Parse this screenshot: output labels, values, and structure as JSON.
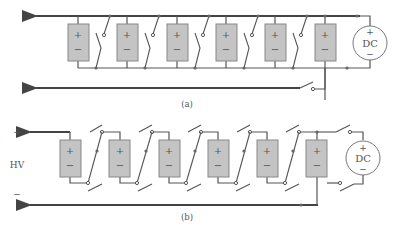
{
  "figure": {
    "panel_a": {
      "label": "(a)",
      "source": {
        "label": "DC",
        "plus": "+",
        "minus": "−"
      },
      "cells": [
        {
          "plus": "+",
          "minus": "−"
        },
        {
          "plus": "+",
          "minus": "−"
        },
        {
          "plus": "+",
          "minus": "−"
        },
        {
          "plus": "+",
          "minus": "−"
        },
        {
          "plus": "+",
          "minus": "−"
        },
        {
          "plus": "+",
          "minus": "−"
        }
      ]
    },
    "panel_b": {
      "label": "(b)",
      "output_label": "HV",
      "output_plus": "+",
      "output_minus": "−",
      "source": {
        "label": "DC",
        "plus": "+",
        "minus": "−"
      },
      "cells": [
        {
          "plus": "+",
          "minus": "−"
        },
        {
          "plus": "+",
          "minus": "−"
        },
        {
          "plus": "+",
          "minus": "−"
        },
        {
          "plus": "+",
          "minus": "−"
        },
        {
          "plus": "+",
          "minus": "−"
        },
        {
          "plus": "+",
          "minus": "−"
        }
      ]
    }
  }
}
